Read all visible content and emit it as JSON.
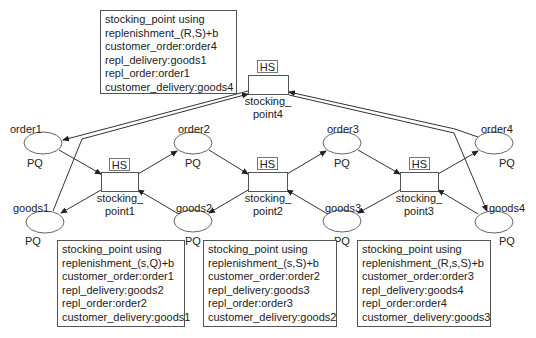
{
  "diagram": {
    "stocking_points": [
      {
        "id": "sp1",
        "name_line1": "stocking_",
        "name_line2": "point1",
        "tag": "HS",
        "info": [
          "stocking_point using",
          "replenishment_(s,Q)+b",
          "customer_order:order1",
          "repl_delivery:goods2",
          "repl_order:order2",
          "customer_delivery:goods1"
        ]
      },
      {
        "id": "sp2",
        "name_line1": "stocking_",
        "name_line2": "point2",
        "tag": "HS",
        "info": [
          "stocking_point using",
          "replenishment_(s,S)+b",
          "customer_order:order2",
          "repl_delivery:goods3",
          "repl_order:order3",
          "customer_delivery:goods2"
        ]
      },
      {
        "id": "sp3",
        "name_line1": "stocking_",
        "name_line2": "point3",
        "tag": "HS",
        "info": [
          "stocking_point using",
          "replenishment_(R,s,S)+b",
          "customer_order:order3",
          "repl_delivery:goods4",
          "repl_order:order4",
          "customer_delivery:goods3"
        ]
      },
      {
        "id": "sp4",
        "name_line1": "stocking_",
        "name_line2": "point4",
        "tag": "HS",
        "info": [
          "stocking_point using",
          "replenishment_(R,S)+b",
          "customer_order:order4",
          "repl_delivery:goods1",
          "repl_order:order1",
          "customer_delivery:goods4"
        ]
      }
    ],
    "places": [
      {
        "id": "order1",
        "label": "order1",
        "type": "PQ"
      },
      {
        "id": "order2",
        "label": "order2",
        "type": "PQ"
      },
      {
        "id": "order3",
        "label": "order3",
        "type": "PQ"
      },
      {
        "id": "order4",
        "label": "order4",
        "type": "PQ"
      },
      {
        "id": "goods1",
        "label": "goods1",
        "type": "PQ"
      },
      {
        "id": "goods2",
        "label": "goods2",
        "type": "PQ"
      },
      {
        "id": "goods3",
        "label": "goods3",
        "type": "PQ"
      },
      {
        "id": "goods4",
        "label": "goods4",
        "type": "PQ"
      }
    ],
    "arcs": [
      {
        "from": "order1",
        "to": "sp1"
      },
      {
        "from": "sp1",
        "to": "order2"
      },
      {
        "from": "order2",
        "to": "sp2"
      },
      {
        "from": "sp2",
        "to": "order3"
      },
      {
        "from": "order3",
        "to": "sp3"
      },
      {
        "from": "sp3",
        "to": "order4"
      },
      {
        "from": "order4",
        "to": "sp4"
      },
      {
        "from": "sp4",
        "to": "order1"
      },
      {
        "from": "goods2",
        "to": "sp1"
      },
      {
        "from": "sp1",
        "to": "goods1"
      },
      {
        "from": "goods3",
        "to": "sp2"
      },
      {
        "from": "sp2",
        "to": "goods2"
      },
      {
        "from": "goods4",
        "to": "sp3"
      },
      {
        "from": "sp3",
        "to": "goods3"
      },
      {
        "from": "goods1",
        "to": "sp4"
      },
      {
        "from": "sp4",
        "to": "goods4"
      }
    ]
  }
}
